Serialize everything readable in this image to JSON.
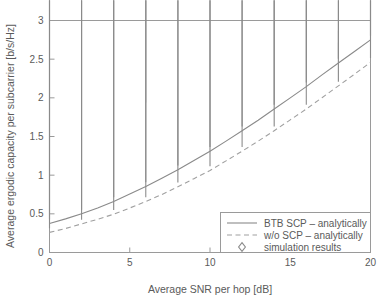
{
  "chart_data": {
    "type": "line",
    "title": "",
    "xlabel": "Average SNR per hop [dB]",
    "ylabel": "Average ergodic capacity per subcarrier [b/s/Hz]",
    "xlim": [
      0,
      20
    ],
    "ylim": [
      0,
      3
    ],
    "xticks": [
      "0",
      "5",
      "10",
      "15",
      "20"
    ],
    "xtick_values": [
      0,
      5,
      10,
      15,
      20
    ],
    "yticks": [
      "0",
      "0.5",
      "1",
      "1.5",
      "2",
      "2.5",
      "3"
    ],
    "ytick_values": [
      0,
      0.5,
      1,
      1.5,
      2,
      2.5,
      3
    ],
    "grid": false,
    "legend_position": "lower right",
    "series": [
      {
        "name": "BTB SCP – analytically",
        "style": "solid",
        "color": "#8a8a8a",
        "x": [
          0,
          1,
          2,
          3,
          4,
          5,
          6,
          7,
          8,
          9,
          10,
          11,
          12,
          13,
          14,
          15,
          16,
          17,
          18,
          19,
          20
        ],
        "values": [
          0.375,
          0.435,
          0.5,
          0.575,
          0.66,
          0.755,
          0.855,
          0.96,
          1.07,
          1.19,
          1.31,
          1.44,
          1.575,
          1.71,
          1.855,
          2.0,
          2.145,
          2.3,
          2.45,
          2.6,
          2.75
        ]
      },
      {
        "name": "w/o SCP – analytically",
        "style": "dashed",
        "color": "#a0a0a0",
        "x": [
          0,
          1,
          2,
          3,
          4,
          5,
          6,
          7,
          8,
          9,
          10,
          11,
          12,
          13,
          14,
          15,
          16,
          17,
          18,
          19,
          20
        ],
        "values": [
          0.26,
          0.31,
          0.37,
          0.43,
          0.495,
          0.575,
          0.66,
          0.75,
          0.85,
          0.955,
          1.06,
          1.185,
          1.31,
          1.44,
          1.575,
          1.715,
          1.855,
          2.005,
          2.155,
          2.305,
          2.46
        ]
      },
      {
        "name": "simulation results",
        "style": "marker",
        "marker": "diamond",
        "color": "#8a8a8a",
        "x": [
          0,
          2,
          4,
          6,
          8,
          10,
          12,
          14,
          16,
          18,
          20
        ],
        "values_upper": [
          0.375,
          0.5,
          0.66,
          0.855,
          1.07,
          1.31,
          1.575,
          1.855,
          2.145,
          2.45,
          2.75
        ],
        "values_lower": [
          0.26,
          0.37,
          0.495,
          0.66,
          0.85,
          1.06,
          1.31,
          1.575,
          1.855,
          2.155,
          2.46
        ]
      }
    ],
    "legend_entries": [
      "BTB SCP – analytically",
      "w/o SCP – analytically",
      "simulation results"
    ]
  }
}
